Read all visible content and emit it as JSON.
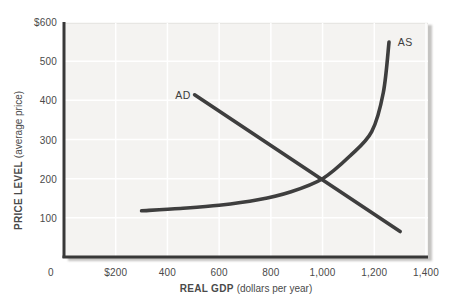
{
  "figure": {
    "background": "#ffffff",
    "plot_background": "#f4f3f1",
    "gridline_color": "#ffffff",
    "axis_color": "#383838",
    "curve_color": "#3e3e3e",
    "text_color": "#4a4a4a",
    "curve_label_color": "#3d3d3d"
  },
  "chart_data": {
    "type": "line",
    "title": "",
    "xlabel_main": "REAL GDP",
    "xlabel_sub": "(dollars per year)",
    "ylabel_main": "PRICE LEVEL",
    "ylabel_sub": "(average price)",
    "xlim": [
      0,
      1400
    ],
    "ylim": [
      0,
      600
    ],
    "grid": true,
    "legend_position": "none",
    "x_ticks": [
      {
        "label": "0",
        "value": 0
      },
      {
        "label": "$200",
        "value": 200
      },
      {
        "label": "400",
        "value": 400
      },
      {
        "label": "600",
        "value": 600
      },
      {
        "label": "800",
        "value": 800
      },
      {
        "label": "1,000",
        "value": 1000
      },
      {
        "label": "1,200",
        "value": 1200
      },
      {
        "label": "1,400",
        "value": 1400
      }
    ],
    "y_ticks": [
      {
        "label": "100",
        "value": 100
      },
      {
        "label": "200",
        "value": 200
      },
      {
        "label": "300",
        "value": 300
      },
      {
        "label": "400",
        "value": 400
      },
      {
        "label": "500",
        "value": 500
      },
      {
        "label": "$600",
        "value": 600
      }
    ],
    "series": [
      {
        "name": "AD",
        "description": "aggregate demand",
        "curve": "linear",
        "color": "#3e3e3e",
        "points": [
          [
            505,
            414
          ],
          [
            1300,
            65
          ]
        ],
        "label_pos": [
          460,
          414
        ]
      },
      {
        "name": "AS",
        "description": "aggregate supply",
        "curve": "smooth",
        "color": "#3e3e3e",
        "points": [
          [
            300,
            118
          ],
          [
            450,
            124
          ],
          [
            600,
            132
          ],
          [
            750,
            146
          ],
          [
            875,
            166
          ],
          [
            1000,
            200
          ],
          [
            1106,
            258
          ],
          [
            1190,
            320
          ],
          [
            1235,
            420
          ],
          [
            1257,
            549
          ]
        ],
        "label_pos": [
          1320,
          549
        ]
      }
    ],
    "intersection": [
      1000,
      200
    ]
  }
}
